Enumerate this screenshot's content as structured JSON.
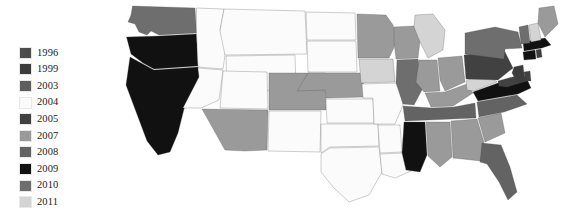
{
  "figure": {
    "type": "choropleth-map",
    "title": "",
    "background_color": "#ffffff",
    "border_color": "#4a4a4a"
  },
  "legend": {
    "name": "year-legend",
    "position": "left",
    "items": [
      {
        "label": "1996",
        "color": "#4d4d4d"
      },
      {
        "label": "1999",
        "color": "#3c3c3c"
      },
      {
        "label": "2003",
        "color": "#5e5e5e"
      },
      {
        "label": "2004",
        "color": "#fbfbfb"
      },
      {
        "label": "2005",
        "color": "#414141"
      },
      {
        "label": "2007",
        "color": "#9a9a9a"
      },
      {
        "label": "2008",
        "color": "#636363"
      },
      {
        "label": "2009",
        "color": "#111111"
      },
      {
        "label": "2010",
        "color": "#6e6e6e"
      },
      {
        "label": "2011",
        "color": "#d4d4d4"
      }
    ]
  },
  "chart_data": {
    "type": "heatmap",
    "title": "",
    "xlabel": "",
    "ylabel": "",
    "legend_position": "left",
    "categories": [
      "1996",
      "1999",
      "2003",
      "2004",
      "2005",
      "2007",
      "2008",
      "2009",
      "2010",
      "2011"
    ],
    "colors": [
      "#4d4d4d",
      "#3c3c3c",
      "#5e5e5e",
      "#fbfbfb",
      "#414141",
      "#9a9a9a",
      "#636363",
      "#111111",
      "#6e6e6e",
      "#d4d4d4"
    ],
    "regions": [
      {
        "id": "WA",
        "name": "Washington",
        "value": "2010",
        "color": "#6e6e6e"
      },
      {
        "id": "OR",
        "name": "Oregon",
        "value": "2009",
        "color": "#111111"
      },
      {
        "id": "CA",
        "name": "California",
        "value": "2009",
        "color": "#111111"
      },
      {
        "id": "ID",
        "name": "Idaho",
        "value": "2004",
        "color": "#fbfbfb"
      },
      {
        "id": "NV",
        "name": "Nevada",
        "value": "2004",
        "color": "#fbfbfb"
      },
      {
        "id": "MT",
        "name": "Montana",
        "value": "2004",
        "color": "#fbfbfb"
      },
      {
        "id": "WY",
        "name": "Wyoming",
        "value": "2004",
        "color": "#fbfbfb"
      },
      {
        "id": "UT",
        "name": "Utah",
        "value": "2004",
        "color": "#fbfbfb"
      },
      {
        "id": "AZ",
        "name": "Arizona",
        "value": "2007",
        "color": "#9a9a9a"
      },
      {
        "id": "CO",
        "name": "Colorado",
        "value": "2007",
        "color": "#9a9a9a"
      },
      {
        "id": "NM",
        "name": "New Mexico",
        "value": "2004",
        "color": "#fbfbfb"
      },
      {
        "id": "ND",
        "name": "North Dakota",
        "value": "2004",
        "color": "#fbfbfb"
      },
      {
        "id": "SD",
        "name": "South Dakota",
        "value": "2004",
        "color": "#fbfbfb"
      },
      {
        "id": "NE",
        "name": "Nebraska",
        "value": "2007",
        "color": "#9a9a9a"
      },
      {
        "id": "KS",
        "name": "Kansas",
        "value": "2004",
        "color": "#fbfbfb"
      },
      {
        "id": "OK",
        "name": "Oklahoma",
        "value": "2004",
        "color": "#fbfbfb"
      },
      {
        "id": "TX",
        "name": "Texas",
        "value": "2004",
        "color": "#fbfbfb"
      },
      {
        "id": "MN",
        "name": "Minnesota",
        "value": "2007",
        "color": "#9a9a9a"
      },
      {
        "id": "IA",
        "name": "Iowa",
        "value": "2011",
        "color": "#d4d4d4"
      },
      {
        "id": "MO",
        "name": "Missouri",
        "value": "2004",
        "color": "#fbfbfb"
      },
      {
        "id": "AR",
        "name": "Arkansas",
        "value": "2004",
        "color": "#fbfbfb"
      },
      {
        "id": "LA",
        "name": "Louisiana",
        "value": "2004",
        "color": "#fbfbfb"
      },
      {
        "id": "WI",
        "name": "Wisconsin",
        "value": "2007",
        "color": "#9a9a9a"
      },
      {
        "id": "IL",
        "name": "Illinois",
        "value": "2010",
        "color": "#6e6e6e"
      },
      {
        "id": "MI",
        "name": "Michigan",
        "value": "2011",
        "color": "#d4d4d4"
      },
      {
        "id": "IN",
        "name": "Indiana",
        "value": "2007",
        "color": "#9a9a9a"
      },
      {
        "id": "OH",
        "name": "Ohio",
        "value": "2007",
        "color": "#9a9a9a"
      },
      {
        "id": "KY",
        "name": "Kentucky",
        "value": "2007",
        "color": "#9a9a9a"
      },
      {
        "id": "TN",
        "name": "Tennessee",
        "value": "2008",
        "color": "#636363"
      },
      {
        "id": "MS",
        "name": "Mississippi",
        "value": "2009",
        "color": "#111111"
      },
      {
        "id": "AL",
        "name": "Alabama",
        "value": "2007",
        "color": "#9a9a9a"
      },
      {
        "id": "GA",
        "name": "Georgia",
        "value": "2007",
        "color": "#9a9a9a"
      },
      {
        "id": "FL",
        "name": "Florida",
        "value": "2008",
        "color": "#636363"
      },
      {
        "id": "SC",
        "name": "South Carolina",
        "value": "2007",
        "color": "#9a9a9a"
      },
      {
        "id": "NC",
        "name": "North Carolina",
        "value": "2008",
        "color": "#636363"
      },
      {
        "id": "VA",
        "name": "Virginia",
        "value": "2009",
        "color": "#111111"
      },
      {
        "id": "WV",
        "name": "West Virginia",
        "value": "2011",
        "color": "#d4d4d4"
      },
      {
        "id": "MD",
        "name": "Maryland",
        "value": "2005",
        "color": "#414141"
      },
      {
        "id": "DE",
        "name": "Delaware",
        "value": "2005",
        "color": "#414141"
      },
      {
        "id": "PA",
        "name": "Pennsylvania",
        "value": "2005",
        "color": "#414141"
      },
      {
        "id": "NJ",
        "name": "New Jersey",
        "value": "1999",
        "color": "#3c3c3c"
      },
      {
        "id": "NY",
        "name": "New York",
        "value": "2010",
        "color": "#6e6e6e"
      },
      {
        "id": "CT",
        "name": "Connecticut",
        "value": "2009",
        "color": "#111111"
      },
      {
        "id": "RI",
        "name": "Rhode Island",
        "value": "1999",
        "color": "#3c3c3c"
      },
      {
        "id": "MA",
        "name": "Massachusetts",
        "value": "2009",
        "color": "#111111"
      },
      {
        "id": "VT",
        "name": "Vermont",
        "value": "2010",
        "color": "#6e6e6e"
      },
      {
        "id": "NH",
        "name": "New Hampshire",
        "value": "2011",
        "color": "#d4d4d4"
      },
      {
        "id": "ME",
        "name": "Maine",
        "value": "2007",
        "color": "#9a9a9a"
      }
    ]
  }
}
